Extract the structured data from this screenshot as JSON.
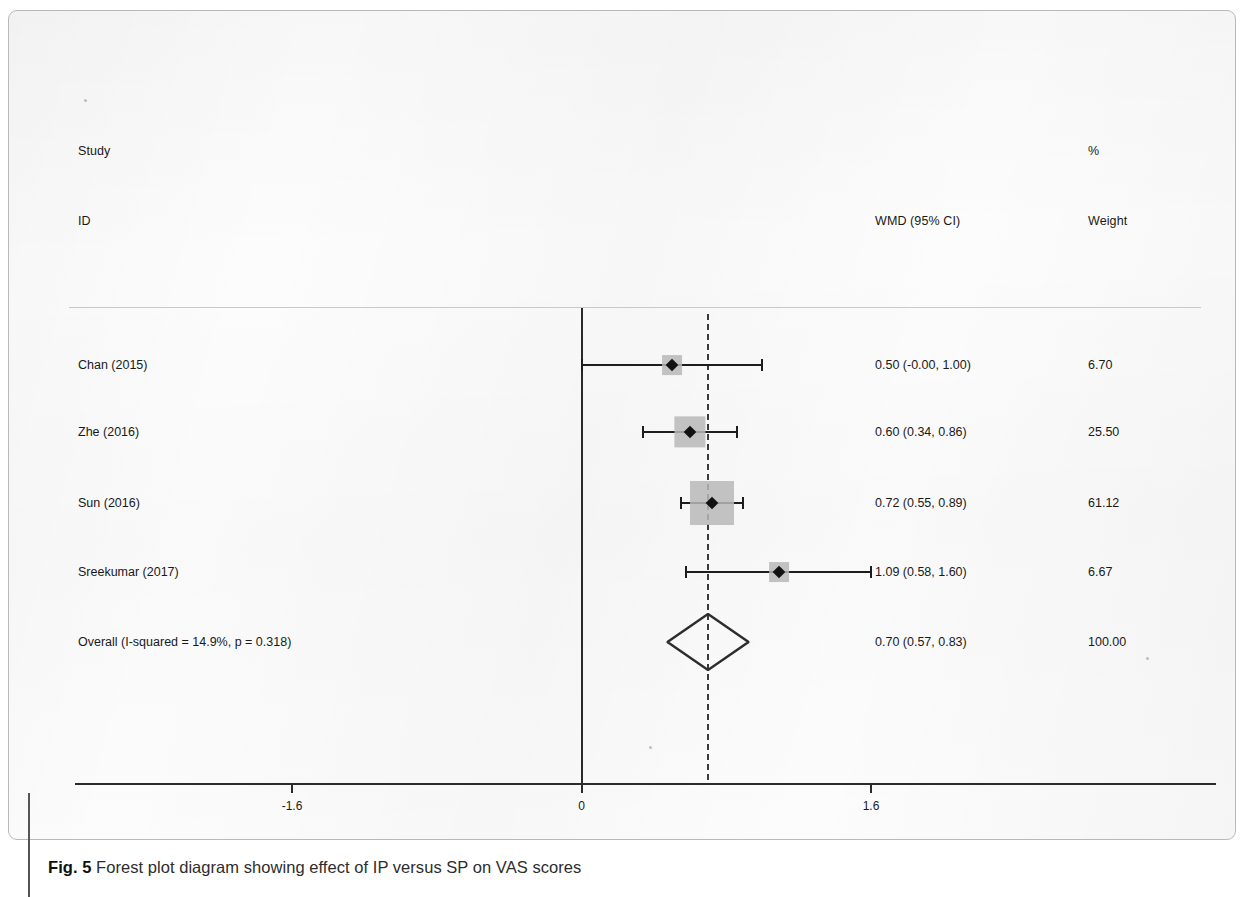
{
  "figure": {
    "caption_number": "Fig. 5",
    "caption_text": " Forest plot diagram showing effect of IP versus SP on VAS scores"
  },
  "headers": {
    "study": "Study",
    "id": "ID",
    "effect": "WMD (95% CI)",
    "percent": "%",
    "weight": "Weight"
  },
  "axis": {
    "ticks": [
      {
        "label": "-1.6",
        "value": -1.6
      },
      {
        "label": "0",
        "value": 0
      },
      {
        "label": "1.6",
        "value": 1.6
      }
    ]
  },
  "chart_data": {
    "type": "forest",
    "title": "",
    "xlabel": "",
    "ylabel": "",
    "xlim": [
      -2.2,
      2.2
    ],
    "grid": false,
    "null_value": 0,
    "pooled_value": 0.7,
    "effect_measure": "WMD (95% CI)",
    "heterogeneity": "I-squared = 14.9%, p = 0.318",
    "i_squared": 14.9,
    "p_value": 0.318,
    "columns": [
      "Study ID",
      "WMD (95% CI)",
      "% Weight"
    ],
    "rows": [
      {
        "study": "Chan (2015)",
        "effect": 0.5,
        "ci_low": -0.0,
        "ci_high": 1.0,
        "effect_text": "0.50 (-0.00, 1.00)",
        "weight": 6.7,
        "weight_text": "6.70"
      },
      {
        "study": "Zhe (2016)",
        "effect": 0.6,
        "ci_low": 0.34,
        "ci_high": 0.86,
        "effect_text": "0.60 (0.34, 0.86)",
        "weight": 25.5,
        "weight_text": "25.50"
      },
      {
        "study": "Sun (2016)",
        "effect": 0.72,
        "ci_low": 0.55,
        "ci_high": 0.89,
        "effect_text": "0.72 (0.55, 0.89)",
        "weight": 61.12,
        "weight_text": "61.12"
      },
      {
        "study": "Sreekumar (2017)",
        "effect": 1.09,
        "ci_low": 0.58,
        "ci_high": 1.6,
        "effect_text": "1.09 (0.58, 1.60)",
        "weight": 6.67,
        "weight_text": "6.67"
      }
    ],
    "overall": {
      "study": "Overall  (I-squared = 14.9%, p = 0.318)",
      "effect": 0.7,
      "ci_low": 0.57,
      "ci_high": 0.83,
      "effect_text": "0.70 (0.57, 0.83)",
      "weight": 100.0,
      "weight_text": "100.00"
    }
  },
  "colors": {
    "marker": "#121212",
    "weight_box": "#b8b8b8",
    "line": "#1d1d1d",
    "axis": "#2b2b2b",
    "rule": "#c9c9c9"
  }
}
